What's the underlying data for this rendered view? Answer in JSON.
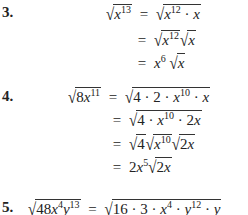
{
  "problems": [
    {
      "number": "3.",
      "lines": [
        {
          "lhs": "√x^13",
          "rhs": "√(x^12 · x)"
        },
        {
          "rhs": "√(x^12) √x"
        },
        {
          "rhs": "x^6 √x"
        }
      ]
    },
    {
      "number": "4.",
      "lines": [
        {
          "lhs": "√(8x^11)",
          "rhs": "√(4 · 2 · x^10 · x)"
        },
        {
          "rhs": "√(4 · x^10 · 2x)"
        },
        {
          "rhs": "√4 √(x^10) √(2x)"
        },
        {
          "rhs": "2x^5 √(2x)"
        }
      ]
    },
    {
      "number": "5.",
      "lines": [
        {
          "lhs": "√(48x^4 y^13)",
          "rhs": "√(16 · 3 · x^4 · y^12 · y)"
        }
      ]
    }
  ],
  "labels": {
    "p3": "3.",
    "p4": "4.",
    "p5": "5.",
    "eq": "="
  }
}
